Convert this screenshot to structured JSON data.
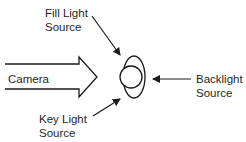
{
  "diagram": {
    "type": "lighting-setup",
    "labels": {
      "fill_light": {
        "line1": "Fill Light",
        "line2": "Source"
      },
      "camera": {
        "line1": "Camera"
      },
      "backlight": {
        "line1": "Backlight",
        "line2": "Source"
      },
      "key_light": {
        "line1": "Key Light",
        "line2": "Source"
      }
    },
    "subject": {
      "shape": "head-outline",
      "description": "circle overlapped by vertical ellipse"
    },
    "colors": {
      "stroke": "#1a1a1a",
      "background": "#ffffff"
    }
  }
}
